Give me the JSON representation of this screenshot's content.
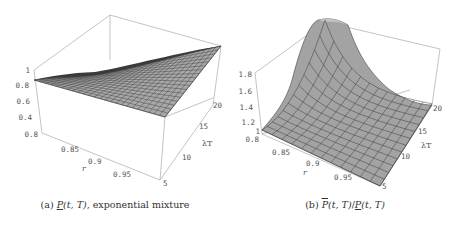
{
  "chart_data": [
    {
      "type": "surface3d",
      "panel": "a",
      "title": "(a) P(t,T), exponential mixture",
      "caption": {
        "prefix": "(a)",
        "symbol": "P",
        "args": "(t, T)",
        "suffix": ", exponential mixture"
      },
      "xlabel": "r",
      "ylabel": "λT",
      "zlabel": "",
      "x_ticks": [
        "0.8",
        "0.85",
        "0.9",
        "0.95"
      ],
      "y_ticks": [
        "5",
        "10",
        "15",
        "20"
      ],
      "z_ticks": [
        "0.4",
        "0.6",
        "0.8",
        "1"
      ],
      "x_range": [
        0.8,
        1.0
      ],
      "y_range": [
        5,
        20
      ],
      "z_range": [
        0.3,
        1.0
      ],
      "description": "Surface near 0.86 at r=0.8; rises toward ~1 at r→1, λT=20; front edge (λT=5) stays roughly flat ~0.85-0.9",
      "sample_values": {
        "r": [
          0.8,
          0.85,
          0.9,
          0.95,
          1.0
        ],
        "lambdaT": [
          5,
          10,
          15,
          20
        ],
        "z": [
          [
            0.86,
            0.86,
            0.86,
            0.86
          ],
          [
            0.87,
            0.88,
            0.89,
            0.9
          ],
          [
            0.88,
            0.9,
            0.92,
            0.94
          ],
          [
            0.89,
            0.92,
            0.95,
            0.97
          ],
          [
            0.9,
            0.94,
            0.97,
            1.0
          ]
        ]
      }
    },
    {
      "type": "surface3d",
      "panel": "b",
      "title": "(b) P̄(t,T)/P(t,T)",
      "caption": {
        "prefix": "(b)",
        "num_symbol": "P",
        "num_args": "(t, T)",
        "slash": "/",
        "den_symbol": "P",
        "den_args": "(t, T)"
      },
      "xlabel": "r",
      "ylabel": "λT",
      "zlabel": "",
      "x_ticks": [
        "0.8",
        "0.85",
        "0.9",
        "0.95"
      ],
      "y_ticks": [
        "5",
        "10",
        "15",
        "20"
      ],
      "z_ticks": [
        "1",
        "1.2",
        "1.4",
        "1.6",
        "1.8"
      ],
      "x_range": [
        0.8,
        1.0
      ],
      "y_range": [
        5,
        20
      ],
      "z_range": [
        1.0,
        1.85
      ],
      "description": "Ratio ~1 over most of domain; sharp peak ~1.85 at r=0.8, λT=20; decays toward 1 as r→1 and λT→5",
      "sample_values": {
        "r": [
          0.8,
          0.85,
          0.9,
          0.95,
          1.0
        ],
        "lambdaT": [
          5,
          10,
          15,
          20
        ],
        "z": [
          [
            1.05,
            1.2,
            1.5,
            1.85
          ],
          [
            1.03,
            1.1,
            1.25,
            1.45
          ],
          [
            1.02,
            1.05,
            1.1,
            1.2
          ],
          [
            1.01,
            1.02,
            1.04,
            1.08
          ],
          [
            1.0,
            1.0,
            1.01,
            1.02
          ]
        ]
      }
    }
  ],
  "panels": {
    "a": {
      "z_ticks": [
        "1",
        "0.8",
        "0.6",
        "0.4",
        "0.8"
      ],
      "x_ticks": [
        "0.85",
        "0.9",
        "0.95"
      ],
      "y_ticks": [
        "5",
        "10",
        "15",
        "20"
      ],
      "xlabel": "r",
      "ylabel": "λT",
      "caption_prefix": "(a) ",
      "caption_symbol": "P",
      "caption_args": "(t, T)",
      "caption_suffix": ", exponential mixture"
    },
    "b": {
      "z_ticks": [
        "1.8",
        "1.6",
        "1.4",
        "1.2",
        "1",
        "0.8"
      ],
      "x_ticks": [
        "0.85",
        "0.9",
        "0.95"
      ],
      "y_ticks": [
        "5",
        "10",
        "15",
        "20"
      ],
      "xlabel": "r",
      "ylabel": "λT",
      "caption_prefix": "(b) ",
      "caption_num": "P",
      "caption_num_args": "(t, T)",
      "caption_slash": "/",
      "caption_den": "P",
      "caption_den_args": "(t, T)"
    }
  },
  "colors": {
    "surface": "#a8a8a8",
    "surface_dark": "#5a5a5a",
    "mesh": "#2a2a2a",
    "box": "#9a9a9a",
    "tick_text": "#555555"
  }
}
